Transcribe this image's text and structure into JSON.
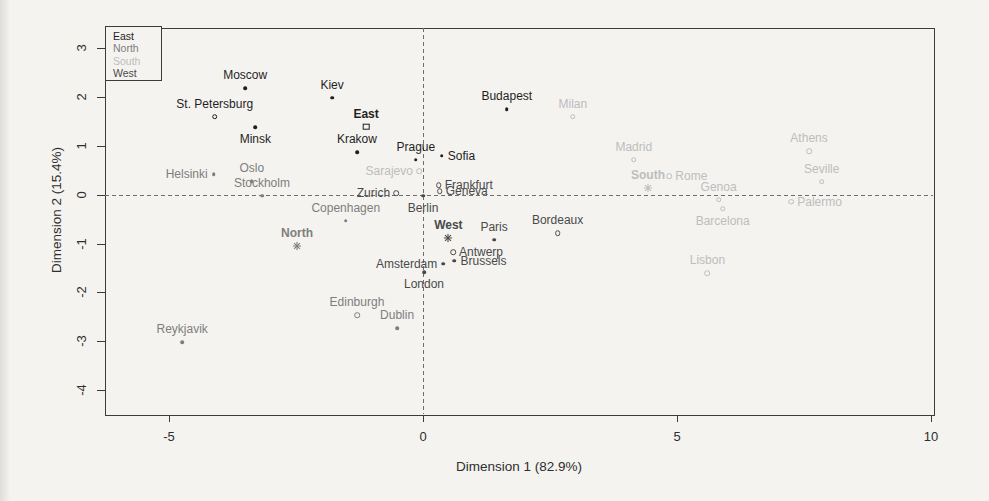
{
  "figure": {
    "background": "#f4f3f0",
    "frame_color": "#3b3b3b",
    "dash_color": "#6e6e6e",
    "text_color": "#2e2e2e"
  },
  "chart_data": {
    "type": "scatter",
    "title": "",
    "xlabel": "Dimension 1 (82.9%)",
    "ylabel": "Dimension 2 (15.4%)",
    "x_axis": {
      "min": -6.26,
      "max": 10.04,
      "ticks": [
        -5,
        0,
        5,
        10
      ]
    },
    "y_axis": {
      "min": -4.49,
      "max": 3.42,
      "ticks": [
        3,
        2,
        1,
        0,
        -1,
        -2,
        -3,
        -4
      ]
    },
    "grid": false,
    "reference_lines": {
      "horizontal_at": 0,
      "vertical_at": 0,
      "style": "dashed"
    },
    "legend": {
      "position": "top-left",
      "order": [
        "East",
        "North",
        "South",
        "West"
      ]
    },
    "groups": {
      "East": {
        "color": "#1f1f1f"
      },
      "North": {
        "color": "#7e7e7e"
      },
      "South": {
        "color": "#bdbdbd"
      },
      "West": {
        "color": "#4a4a4a"
      }
    },
    "series": [
      {
        "name": "South",
        "points": [
          {
            "label": "Sarajevo",
            "x": -0.08,
            "y": 0.48,
            "marker": "circle",
            "label_pos": "left"
          },
          {
            "label": "Milan",
            "x": 2.95,
            "y": 1.6,
            "marker": "circle",
            "label_pos": "above"
          },
          {
            "label": "Madrid",
            "x": 4.15,
            "y": 0.72,
            "marker": "circle",
            "label_pos": "above"
          },
          {
            "label": "Rome",
            "x": 4.85,
            "y": 0.38,
            "marker": "circle",
            "label_pos": "right"
          },
          {
            "label": "Genoa",
            "x": 5.82,
            "y": -0.1,
            "marker": "circle",
            "label_pos": "above"
          },
          {
            "label": "Barcelona",
            "x": 5.9,
            "y": -0.28,
            "marker": "circle",
            "label_pos": "below"
          },
          {
            "label": "Lisbon",
            "x": 5.6,
            "y": -1.6,
            "marker": "circle",
            "label_pos": "above"
          },
          {
            "label": "Athens",
            "x": 7.6,
            "y": 0.9,
            "marker": "circle",
            "label_pos": "above"
          },
          {
            "label": "Seville",
            "x": 7.85,
            "y": 0.27,
            "marker": "circle",
            "label_pos": "above"
          },
          {
            "label": "Palermo",
            "x": 7.25,
            "y": -0.14,
            "marker": "circle",
            "label_pos": "right"
          },
          {
            "label": "South",
            "x": 4.43,
            "y": 0.14,
            "marker": "asterisk",
            "label_pos": "above",
            "centroid": true
          }
        ]
      },
      {
        "name": "North",
        "points": [
          {
            "label": "Helsinki",
            "x": -4.12,
            "y": 0.42,
            "marker": "dot",
            "label_pos": "left"
          },
          {
            "label": "Oslo",
            "x": -3.37,
            "y": 0.28,
            "marker": "dot",
            "label_pos": "above"
          },
          {
            "label": "Stockholm",
            "x": -3.17,
            "y": -0.02,
            "marker": "dot",
            "label_pos": "above"
          },
          {
            "label": "Copenhagen",
            "x": -1.52,
            "y": -0.53,
            "marker": "dot",
            "label_pos": "above"
          },
          {
            "label": "Reykjavik",
            "x": -4.74,
            "y": -3.02,
            "marker": "dot",
            "label_pos": "above"
          },
          {
            "label": "Edinburgh",
            "x": -1.3,
            "y": -2.46,
            "marker": "circle",
            "label_pos": "above"
          },
          {
            "label": "Dublin",
            "x": -0.51,
            "y": -2.73,
            "marker": "dot",
            "label_pos": "above"
          },
          {
            "label": "North",
            "x": -2.48,
            "y": -1.04,
            "marker": "asterisk",
            "label_pos": "above",
            "centroid": true
          }
        ]
      },
      {
        "name": "West",
        "points": [
          {
            "label": "Zurich",
            "x": -0.53,
            "y": 0.04,
            "marker": "circle",
            "label_pos": "left"
          },
          {
            "label": "Frankfurt",
            "x": 0.31,
            "y": 0.2,
            "marker": "circle",
            "label_pos": "right"
          },
          {
            "label": "Geneva",
            "x": 0.33,
            "y": 0.08,
            "marker": "circle",
            "label_pos": "right"
          },
          {
            "label": "Berlin",
            "x": 0.0,
            "y": -0.02,
            "marker": "dot",
            "label_pos": "below"
          },
          {
            "label": "Paris",
            "x": 1.4,
            "y": -0.92,
            "marker": "dot",
            "label_pos": "above"
          },
          {
            "label": "Antwerp",
            "x": 0.59,
            "y": -1.17,
            "marker": "circle",
            "label_pos": "right"
          },
          {
            "label": "Brussels",
            "x": 0.62,
            "y": -1.35,
            "marker": "dot",
            "label_pos": "right"
          },
          {
            "label": "Amsterdam",
            "x": 0.4,
            "y": -1.41,
            "marker": "dot",
            "label_pos": "left"
          },
          {
            "label": "London",
            "x": 0.02,
            "y": -1.58,
            "marker": "dot",
            "label_pos": "below"
          },
          {
            "label": "Bordeaux",
            "x": 2.65,
            "y": -0.78,
            "marker": "circle",
            "label_pos": "above"
          },
          {
            "label": "West",
            "x": 0.5,
            "y": -0.88,
            "marker": "asterisk",
            "label_pos": "above",
            "centroid": true
          }
        ]
      },
      {
        "name": "East",
        "points": [
          {
            "label": "Moscow",
            "x": -3.5,
            "y": 2.19,
            "marker": "dot",
            "label_pos": "above"
          },
          {
            "label": "St. Petersburg",
            "x": -4.1,
            "y": 1.6,
            "marker": "circle",
            "label_pos": "above"
          },
          {
            "label": "Minsk",
            "x": -3.3,
            "y": 1.39,
            "marker": "dot",
            "label_pos": "below"
          },
          {
            "label": "Kiev",
            "x": -1.79,
            "y": 1.99,
            "marker": "dot",
            "label_pos": "above"
          },
          {
            "label": "Krakow",
            "x": -1.3,
            "y": 0.88,
            "marker": "dot",
            "label_pos": "above"
          },
          {
            "label": "Prague",
            "x": -0.14,
            "y": 0.72,
            "marker": "dot",
            "label_pos": "above"
          },
          {
            "label": "Sofia",
            "x": 0.37,
            "y": 0.8,
            "marker": "dot",
            "label_pos": "right"
          },
          {
            "label": "Budapest",
            "x": 1.65,
            "y": 1.76,
            "marker": "dot",
            "label_pos": "above"
          },
          {
            "label": "East",
            "x": -1.12,
            "y": 1.4,
            "marker": "square-open",
            "label_pos": "above",
            "centroid": true
          }
        ]
      }
    ]
  }
}
